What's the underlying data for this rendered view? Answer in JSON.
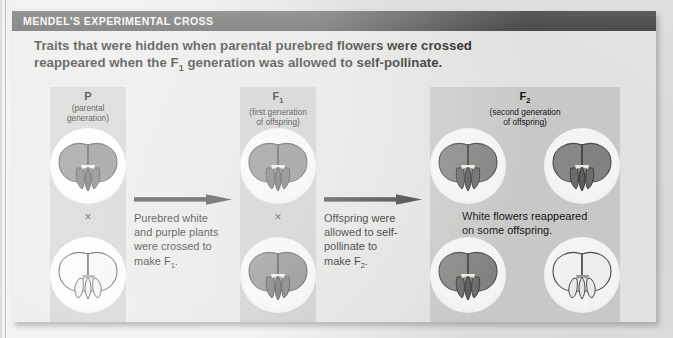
{
  "figure": {
    "header_title": "MENDEL'S EXPERIMENTAL CROSS",
    "subtitle_line1": "Traits that were hidden when parental purebred flowers were crossed",
    "subtitle_line2_a": "reappeared when the F",
    "subtitle_line2_sub": "1",
    "subtitle_line2_b": " generation was allowed to self-pollinate."
  },
  "columns": [
    {
      "key": "P",
      "title": "P",
      "title_sub": "",
      "desc_line1": "(parental",
      "desc_line2": "generation)",
      "cross_symbol": "×",
      "flowers": [
        {
          "color_name": "purple",
          "position": "top"
        },
        {
          "color_name": "white",
          "position": "bottom"
        }
      ]
    },
    {
      "key": "F1",
      "title": "F",
      "title_sub": "1",
      "desc_line1": "(first generation",
      "desc_line2": "of offspring)",
      "cross_symbol": "×",
      "flowers": [
        {
          "color_name": "purple",
          "position": "top"
        },
        {
          "color_name": "purple",
          "position": "bottom"
        }
      ]
    },
    {
      "key": "F2",
      "title": "F",
      "title_sub": "2",
      "desc_line1": "(second generation",
      "desc_line2": "of offspring)",
      "cross_symbol": "",
      "flowers": [
        {
          "color_name": "purple",
          "position": "top-left"
        },
        {
          "color_name": "purple",
          "position": "top-right"
        },
        {
          "color_name": "purple",
          "position": "bottom-left"
        },
        {
          "color_name": "white",
          "position": "bottom-right"
        }
      ]
    }
  ],
  "captions": [
    {
      "id": "cross-to-f1",
      "line1": "Purebred white",
      "line2": "and purple plants",
      "line3": "were crossed to",
      "line4_a": "make F",
      "line4_sub": "1",
      "line4_b": "."
    },
    {
      "id": "self-pollinate-to-f2",
      "line1": "Offspring were",
      "line2": "allowed to self-",
      "line3": "pollinate to",
      "line4_a": "make F",
      "line4_sub": "2",
      "line4_b": "."
    },
    {
      "id": "f2-result",
      "line1": "White flowers reappeared",
      "line2": "on some offspring."
    }
  ],
  "arrows": [
    {
      "id": "arrow-p-to-f1",
      "direction": "right"
    },
    {
      "id": "arrow-f1-to-f2",
      "direction": "right"
    }
  ],
  "colors": {
    "header_bar": "#545452",
    "band": "#cfcfcd",
    "paper": "#e9e9e7",
    "purple_flower": "#8b8b89",
    "white_flower": "#f7f7f5",
    "text": "#141414",
    "arrow": "#3a3a38"
  }
}
